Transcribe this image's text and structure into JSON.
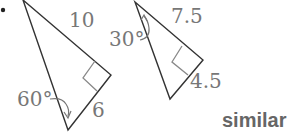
{
  "figure": {
    "bullet": "•",
    "triangle_a": {
      "hypotenuse_label": "10",
      "angle_label": "60°",
      "side_label": "6",
      "vertices": [
        [
          23,
          0
        ],
        [
          111,
          75
        ],
        [
          68,
          130
        ]
      ],
      "right_angle_at": [
        111,
        75
      ]
    },
    "triangle_b": {
      "hypotenuse_label": "7.5",
      "angle_label": "30°",
      "side_label": "4.5",
      "vertices": [
        [
          135,
          2
        ],
        [
          203,
          60
        ],
        [
          170,
          99
        ]
      ],
      "right_angle_at": [
        203,
        60
      ]
    },
    "answer": "similar"
  },
  "colors": {
    "stroke": "#333333",
    "right_angle_marker": "#888888",
    "label": "#777777",
    "answer": "#666666"
  }
}
